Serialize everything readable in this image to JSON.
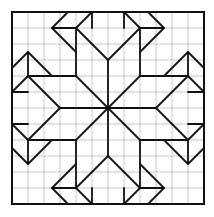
{
  "diagram": {
    "type": "quilt-block-pattern",
    "grid": {
      "cells": 12,
      "origin_px": [
        12,
        12
      ],
      "cell_px": 16,
      "grid_color": "#c8c8c8",
      "line_color": "#111111",
      "background": "#ffffff"
    },
    "center": [
      6,
      6
    ],
    "symmetry": "D4 (8-fold) about center",
    "base_segments": [
      {
        "from": [
          3.5,
          0
        ],
        "to": [
          2.5,
          1
        ]
      },
      {
        "from": [
          2.5,
          1
        ],
        "to": [
          4,
          1
        ]
      },
      {
        "from": [
          5,
          0
        ],
        "to": [
          5,
          1
        ]
      },
      {
        "from": [
          5,
          0
        ],
        "to": [
          4,
          1
        ]
      },
      {
        "from": [
          4,
          1
        ],
        "to": [
          4,
          4
        ]
      },
      {
        "from": [
          2.5,
          1
        ],
        "to": [
          4,
          2.5
        ]
      },
      {
        "from": [
          4,
          1
        ],
        "to": [
          6,
          3
        ]
      },
      {
        "from": [
          6,
          3
        ],
        "to": [
          6,
          6
        ]
      },
      {
        "from": [
          4,
          4
        ],
        "to": [
          6,
          6
        ]
      }
    ]
  }
}
